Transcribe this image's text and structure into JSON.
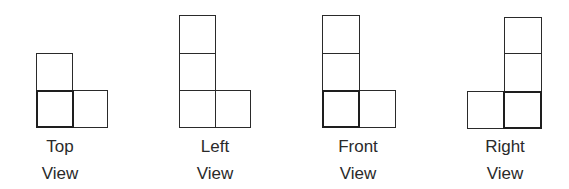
{
  "views": [
    {
      "name": "top",
      "label_line1": "Top",
      "label_line2": "View",
      "label_center_x": 60,
      "squares": [
        {
          "x": 36,
          "y": 53,
          "w": 37,
          "h": 38,
          "bold": false
        },
        {
          "x": 73,
          "y": 90,
          "w": 35,
          "h": 38,
          "bold": false
        },
        {
          "x": 36,
          "y": 90,
          "w": 38,
          "h": 38,
          "bold": true
        }
      ]
    },
    {
      "name": "left",
      "label_line1": "Left",
      "label_line2": "View",
      "label_center_x": 215,
      "squares": [
        {
          "x": 179,
          "y": 15,
          "w": 37,
          "h": 39,
          "bold": false
        },
        {
          "x": 179,
          "y": 53,
          "w": 37,
          "h": 38,
          "bold": false
        },
        {
          "x": 179,
          "y": 90,
          "w": 37,
          "h": 38,
          "bold": false
        },
        {
          "x": 215,
          "y": 90,
          "w": 36,
          "h": 38,
          "bold": false
        }
      ]
    },
    {
      "name": "front",
      "label_line1": "Front",
      "label_line2": "View",
      "label_center_x": 358,
      "squares": [
        {
          "x": 322,
          "y": 15,
          "w": 38,
          "h": 39,
          "bold": false
        },
        {
          "x": 322,
          "y": 53,
          "w": 38,
          "h": 38,
          "bold": false
        },
        {
          "x": 359,
          "y": 90,
          "w": 37,
          "h": 38,
          "bold": false
        },
        {
          "x": 322,
          "y": 90,
          "w": 38,
          "h": 38,
          "bold": true
        }
      ]
    },
    {
      "name": "right",
      "label_line1": "Right",
      "label_line2": "View",
      "label_center_x": 505,
      "squares": [
        {
          "x": 504,
          "y": 17,
          "w": 38,
          "h": 37,
          "bold": false
        },
        {
          "x": 504,
          "y": 53,
          "w": 38,
          "h": 39,
          "bold": false
        },
        {
          "x": 467,
          "y": 91,
          "w": 38,
          "h": 38,
          "bold": false
        },
        {
          "x": 503,
          "y": 91,
          "w": 39,
          "h": 38,
          "bold": true
        }
      ]
    }
  ],
  "label_y_line1": 134,
  "label_y_line2": 161
}
